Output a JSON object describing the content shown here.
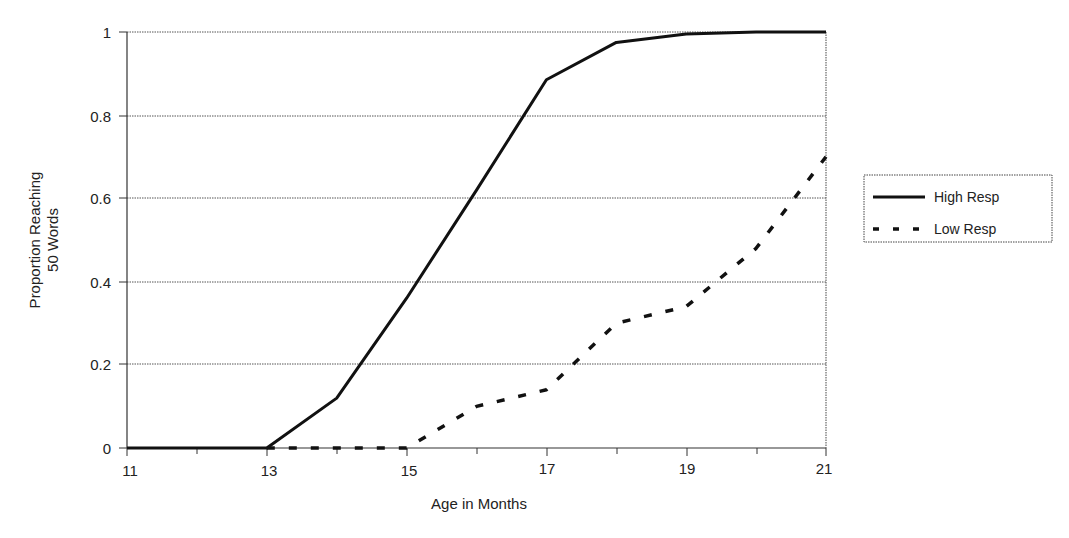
{
  "chart_data": {
    "type": "line",
    "title": "",
    "xlabel": "Age in Months",
    "ylabel": "Proportion Reaching 50 Words",
    "ylabel_lines": [
      "Proportion Reaching",
      "50 Words"
    ],
    "x": [
      11,
      12,
      13,
      14,
      15,
      16,
      17,
      18,
      19,
      20,
      21
    ],
    "x_tick_labels": [
      "11",
      "13",
      "15",
      "17",
      "19",
      "21"
    ],
    "y_tick_labels": [
      "0",
      "0.2",
      "0.4",
      "0.6",
      "0.8",
      "1"
    ],
    "xlim": [
      11,
      21
    ],
    "ylim": [
      0,
      1
    ],
    "grid": "horizontal dotted",
    "legend_position": "right",
    "series": [
      {
        "name": "High Resp",
        "style": "solid",
        "values": [
          0,
          0,
          0,
          0.12,
          0.36,
          0.62,
          0.885,
          0.975,
          0.995,
          1.0,
          1.0
        ]
      },
      {
        "name": "Low Resp",
        "style": "dashed",
        "values": [
          0,
          0,
          0,
          0,
          0,
          0.1,
          0.14,
          0.3,
          0.34,
          0.48,
          0.7
        ]
      }
    ]
  },
  "legend": {
    "items": [
      {
        "label": "High Resp"
      },
      {
        "label": "Low Resp"
      }
    ]
  },
  "axes": {
    "x_title": "Age in Months",
    "y_title_line1": "Proportion Reaching",
    "y_title_line2": "50 Words",
    "y_ticks": [
      "1",
      "0.8",
      "0.6",
      "0.4",
      "0.2",
      "0"
    ],
    "x_ticks": [
      "11",
      "13",
      "15",
      "17",
      "19",
      "21"
    ]
  }
}
